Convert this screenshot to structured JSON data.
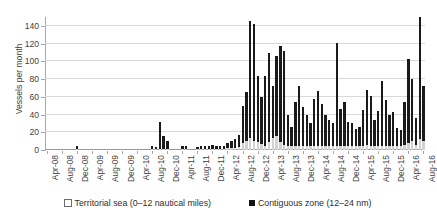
{
  "chart_data": {
    "type": "bar",
    "subtype": "stacked-column",
    "title": "",
    "xlabel": "",
    "ylabel": "Vessels per month",
    "ylim": [
      0,
      150
    ],
    "yticks": [
      0,
      20,
      40,
      60,
      80,
      100,
      120,
      140
    ],
    "grid": true,
    "legend_position": "bottom",
    "legend": [
      "Territorial sea (0–12 nautical miles)",
      "Contiguous zone (12–24 nm)"
    ],
    "colors": {
      "territorial_sea": "#d2d2d2",
      "contiguous_zone": "#1a1a1a",
      "gridline": "#d9d9d9",
      "axis": "#a8a8a8",
      "text": "#3f3f3f"
    },
    "x_tick_labels": [
      "Apr-08",
      "Aug-08",
      "Dec-08",
      "Apr-09",
      "Aug-09",
      "Dec-09",
      "Apr-10",
      "Aug-10",
      "Dec-10",
      "Apr-11",
      "Aug-11",
      "Dec-11",
      "Apr-12",
      "Aug-12",
      "Dec-12",
      "Apr-13",
      "Aug-13",
      "Dec-13",
      "Apr-14",
      "Aug-14",
      "Dec-14",
      "Apr-15",
      "Aug-15",
      "Dec-15",
      "Apr-16",
      "Aug-16"
    ],
    "x_tick_every": 4,
    "categories": [
      "Apr-08",
      "May-08",
      "Jun-08",
      "Jul-08",
      "Aug-08",
      "Sep-08",
      "Oct-08",
      "Nov-08",
      "Dec-08",
      "Jan-09",
      "Feb-09",
      "Mar-09",
      "Apr-09",
      "May-09",
      "Jun-09",
      "Jul-09",
      "Aug-09",
      "Sep-09",
      "Oct-09",
      "Nov-09",
      "Dec-09",
      "Jan-10",
      "Feb-10",
      "Mar-10",
      "Apr-10",
      "May-10",
      "Jun-10",
      "Jul-10",
      "Aug-10",
      "Sep-10",
      "Oct-10",
      "Nov-10",
      "Dec-10",
      "Jan-11",
      "Feb-11",
      "Mar-11",
      "Apr-11",
      "May-11",
      "Jun-11",
      "Jul-11",
      "Aug-11",
      "Sep-11",
      "Oct-11",
      "Nov-11",
      "Dec-11",
      "Jan-12",
      "Feb-12",
      "Mar-12",
      "Apr-12",
      "May-12",
      "Jun-12",
      "Jul-12",
      "Aug-12",
      "Sep-12",
      "Oct-12",
      "Nov-12",
      "Dec-12",
      "Jan-13",
      "Feb-13",
      "Mar-13",
      "Apr-13",
      "May-13",
      "Jun-13",
      "Jul-13",
      "Aug-13",
      "Sep-13",
      "Oct-13",
      "Nov-13",
      "Dec-13",
      "Jan-14",
      "Feb-14",
      "Mar-14",
      "Apr-14",
      "May-14",
      "Jun-14",
      "Jul-14",
      "Aug-14",
      "Sep-14",
      "Oct-14",
      "Nov-14",
      "Dec-14",
      "Jan-15",
      "Feb-15",
      "Mar-15",
      "Apr-15",
      "May-15",
      "Jun-15",
      "Jul-15",
      "Aug-15",
      "Sep-15",
      "Oct-15",
      "Nov-15",
      "Dec-15",
      "Jan-16",
      "Feb-16",
      "Mar-16",
      "Apr-16",
      "May-16",
      "Jun-16",
      "Jul-16",
      "Aug-16"
    ],
    "series": [
      {
        "name": "Territorial sea (0–12 nautical miles)",
        "color": "#d2d2d2",
        "values": [
          0,
          0,
          0,
          0,
          0,
          0,
          0,
          0,
          1,
          0,
          0,
          0,
          0,
          0,
          0,
          0,
          0,
          0,
          0,
          0,
          0,
          0,
          0,
          0,
          0,
          0,
          0,
          0,
          1,
          1,
          1,
          1,
          1,
          0,
          0,
          0,
          1,
          1,
          0,
          0,
          1,
          1,
          1,
          1,
          1,
          1,
          1,
          1,
          2,
          2,
          2,
          3,
          8,
          10,
          14,
          10,
          9,
          7,
          5,
          9,
          13,
          16,
          9,
          6,
          4,
          4,
          4,
          4,
          4,
          4,
          4,
          5,
          5,
          4,
          4,
          4,
          4,
          4,
          4,
          4,
          4,
          4,
          4,
          4,
          5,
          6,
          5,
          4,
          4,
          4,
          4,
          5,
          5,
          5,
          5,
          6,
          8,
          10,
          6,
          14,
          10
        ]
      },
      {
        "name": "Contiguous zone (12–24 nm)",
        "color": "#1a1a1a",
        "values": [
          0,
          0,
          0,
          0,
          0,
          0,
          0,
          0,
          3,
          0,
          0,
          0,
          0,
          0,
          0,
          0,
          0,
          0,
          0,
          0,
          0,
          0,
          0,
          0,
          0,
          0,
          0,
          0,
          3,
          2,
          31,
          15,
          9,
          0,
          0,
          0,
          3,
          4,
          0,
          0,
          2,
          4,
          3,
          4,
          5,
          3,
          3,
          4,
          6,
          8,
          10,
          14,
          42,
          56,
          131,
          132,
          74,
          53,
          78,
          100,
          59,
          90,
          108,
          106,
          36,
          22,
          50,
          68,
          44,
          36,
          27,
          52,
          62,
          48,
          36,
          30,
          26,
          117,
          42,
          50,
          28,
          26,
          20,
          22,
          40,
          62,
          56,
          30,
          40,
          74,
          52,
          34,
          38,
          20,
          18,
          48,
          95,
          70,
          30,
          148,
          62
        ]
      }
    ]
  }
}
